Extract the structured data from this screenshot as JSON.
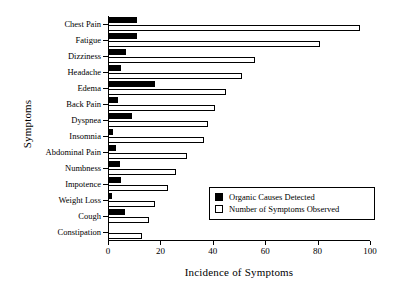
{
  "chart_data": {
    "type": "bar",
    "orientation": "horizontal",
    "title": "",
    "xlabel": "Incidence of Symptoms",
    "ylabel": "Symptoms",
    "xlim": [
      0,
      100
    ],
    "xticks": [
      0,
      20,
      40,
      60,
      80,
      100
    ],
    "grid": false,
    "legend_position": "lower-right-inside",
    "categories": [
      "Chest Pain",
      "Fatigue",
      "Dizziness",
      "Headache",
      "Edema",
      "Back Pain",
      "Dyspnea",
      "Insomnia",
      "Abdominal Pain",
      "Numbness",
      "Impotence",
      "Weight Loss",
      "Cough",
      "Constipation"
    ],
    "series": [
      {
        "name": "Organic Causes Detected",
        "color": "#000000",
        "fill": "solid",
        "values": [
          11,
          11,
          7,
          5,
          18,
          4,
          9,
          2,
          3,
          4.5,
          5,
          1.5,
          6.5,
          0
        ]
      },
      {
        "name": "Number of Symptoms Observed",
        "color": "#ffffff",
        "fill": "open",
        "values": [
          96,
          81,
          56,
          51,
          45,
          41,
          38,
          36.5,
          30,
          26,
          23,
          18,
          15.5,
          13
        ]
      }
    ]
  },
  "legend": {
    "entries": [
      {
        "label": "Organic Causes Detected",
        "swatch": "filled-black-square"
      },
      {
        "label": "Number of Symptoms Observed",
        "swatch": "open-white-square"
      }
    ]
  }
}
